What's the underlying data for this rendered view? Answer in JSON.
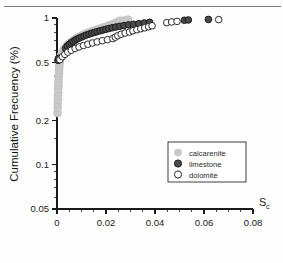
{
  "figure": {
    "top_rule": "horizontal-rule"
  },
  "chart_data": {
    "type": "scatter",
    "title": "",
    "xlabel": "S",
    "xlabel_sub": "c",
    "ylabel": "Cumulative Frecuency (%)",
    "xlim": [
      0,
      0.08
    ],
    "ylim": [
      0.05,
      1
    ],
    "yscale": "log",
    "xscale": "linear",
    "grid": false,
    "legend_position": "center-right",
    "xticks": [
      "0",
      "0.02",
      "0.04",
      "0.06",
      "0.08"
    ],
    "xtick_values": [
      0,
      0.02,
      0.04,
      0.06,
      0.08
    ],
    "x_minor_count": 4,
    "yticks": [
      "1",
      "0.5",
      "0.2",
      "0.1",
      "0.05"
    ],
    "ytick_values": [
      1,
      0.5,
      0.2,
      0.1,
      0.05
    ],
    "series": [
      {
        "name": "calcarenite",
        "marker": "filled-circle",
        "color": "#c9c9c9",
        "edge": "#bdbdbd",
        "points": [
          [
            0.0002,
            0.225
          ],
          [
            0.0003,
            0.245
          ],
          [
            0.0003,
            0.262
          ],
          [
            0.0004,
            0.278
          ],
          [
            0.0004,
            0.295
          ],
          [
            0.0005,
            0.312
          ],
          [
            0.0005,
            0.33
          ],
          [
            0.0006,
            0.348
          ],
          [
            0.0006,
            0.366
          ],
          [
            0.0007,
            0.384
          ],
          [
            0.0007,
            0.402
          ],
          [
            0.0008,
            0.42
          ],
          [
            0.0008,
            0.438
          ],
          [
            0.0009,
            0.455
          ],
          [
            0.0009,
            0.472
          ],
          [
            0.001,
            0.49
          ],
          [
            0.0011,
            0.505
          ],
          [
            0.0012,
            0.52
          ],
          [
            0.0014,
            0.536
          ],
          [
            0.0016,
            0.551
          ],
          [
            0.0019,
            0.567
          ],
          [
            0.0022,
            0.583
          ],
          [
            0.0026,
            0.599
          ],
          [
            0.003,
            0.614
          ],
          [
            0.0035,
            0.63
          ],
          [
            0.004,
            0.645
          ],
          [
            0.0046,
            0.66
          ],
          [
            0.0052,
            0.674
          ],
          [
            0.0059,
            0.689
          ],
          [
            0.0066,
            0.703
          ],
          [
            0.0074,
            0.717
          ],
          [
            0.0082,
            0.731
          ],
          [
            0.0091,
            0.745
          ],
          [
            0.01,
            0.758
          ],
          [
            0.011,
            0.772
          ],
          [
            0.012,
            0.785
          ],
          [
            0.0131,
            0.798
          ],
          [
            0.0142,
            0.811
          ],
          [
            0.0153,
            0.823
          ],
          [
            0.0164,
            0.835
          ],
          [
            0.0175,
            0.847
          ],
          [
            0.0186,
            0.858
          ],
          [
            0.0196,
            0.869
          ],
          [
            0.0206,
            0.88
          ],
          [
            0.0215,
            0.89
          ],
          [
            0.0223,
            0.9
          ],
          [
            0.0231,
            0.91
          ],
          [
            0.0238,
            0.92
          ],
          [
            0.0244,
            0.93
          ],
          [
            0.0249,
            0.94
          ],
          [
            0.0254,
            0.95
          ],
          [
            0.0258,
            0.958
          ],
          [
            0.0276,
            0.965
          ],
          [
            0.029,
            0.972
          ]
        ]
      },
      {
        "name": "limestone",
        "marker": "filled-circle",
        "color": "#4a4a4a",
        "edge": "#1c1c1c",
        "points": [
          [
            0.0004,
            0.515
          ],
          [
            0.0006,
            0.53
          ],
          [
            0.0035,
            0.62
          ],
          [
            0.0042,
            0.645
          ],
          [
            0.005,
            0.662
          ],
          [
            0.0058,
            0.678
          ],
          [
            0.0066,
            0.692
          ],
          [
            0.0074,
            0.706
          ],
          [
            0.0082,
            0.718
          ],
          [
            0.0091,
            0.73
          ],
          [
            0.01,
            0.742
          ],
          [
            0.011,
            0.754
          ],
          [
            0.012,
            0.766
          ],
          [
            0.0131,
            0.777
          ],
          [
            0.0142,
            0.788
          ],
          [
            0.0153,
            0.798
          ],
          [
            0.0164,
            0.808
          ],
          [
            0.0176,
            0.818
          ],
          [
            0.0188,
            0.828
          ],
          [
            0.02,
            0.838
          ],
          [
            0.0212,
            0.848
          ],
          [
            0.0225,
            0.858
          ],
          [
            0.024,
            0.868
          ],
          [
            0.0256,
            0.878
          ],
          [
            0.0273,
            0.888
          ],
          [
            0.0292,
            0.898
          ],
          [
            0.0312,
            0.906
          ],
          [
            0.0334,
            0.915
          ],
          [
            0.0356,
            0.925
          ],
          [
            0.0378,
            0.935
          ],
          [
            0.052,
            0.965
          ],
          [
            0.0536,
            0.97
          ],
          [
            0.0618,
            0.978
          ]
        ]
      },
      {
        "name": "dolomite",
        "marker": "open-circle",
        "color": "#ffffff",
        "edge": "#2a2a2a",
        "points": [
          [
            0.0012,
            0.52
          ],
          [
            0.0022,
            0.545
          ],
          [
            0.0032,
            0.565
          ],
          [
            0.0044,
            0.585
          ],
          [
            0.0058,
            0.603
          ],
          [
            0.0074,
            0.62
          ],
          [
            0.009,
            0.635
          ],
          [
            0.0108,
            0.65
          ],
          [
            0.0126,
            0.663
          ],
          [
            0.0145,
            0.676
          ],
          [
            0.0164,
            0.688
          ],
          [
            0.0185,
            0.7
          ],
          [
            0.0206,
            0.712
          ],
          [
            0.0228,
            0.724
          ],
          [
            0.0238,
            0.74
          ],
          [
            0.0248,
            0.758
          ],
          [
            0.0262,
            0.775
          ],
          [
            0.0278,
            0.79
          ],
          [
            0.0296,
            0.802
          ],
          [
            0.031,
            0.818
          ],
          [
            0.0326,
            0.832
          ],
          [
            0.0342,
            0.845
          ],
          [
            0.0358,
            0.858
          ],
          [
            0.0374,
            0.872
          ],
          [
            0.0388,
            0.885
          ],
          [
            0.0448,
            0.93
          ],
          [
            0.0468,
            0.94
          ],
          [
            0.049,
            0.948
          ],
          [
            0.066,
            0.975
          ]
        ]
      }
    ]
  },
  "legend": {
    "items": [
      {
        "label": "calcarenite"
      },
      {
        "label": "limestone"
      },
      {
        "label": "dolomite"
      }
    ]
  }
}
